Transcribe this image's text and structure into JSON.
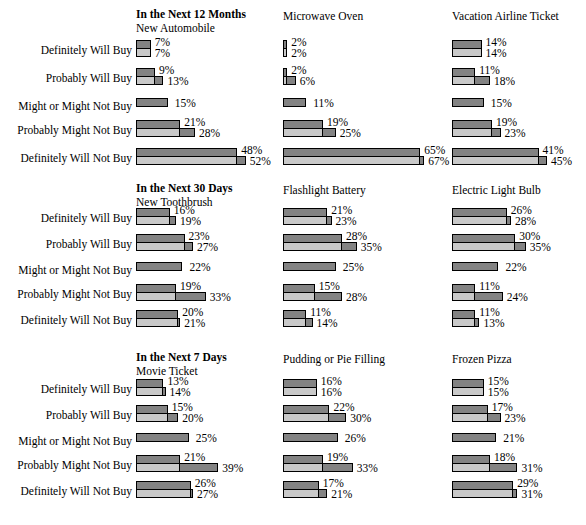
{
  "figure": {
    "row_labels": [
      "Definitely Will Buy",
      "Probably Will Buy",
      "Might or Might Not Buy",
      "Probably Might Not Buy",
      "Definitely Will Not Buy"
    ]
  },
  "chart_data": {
    "type": "bar",
    "xlabel": "",
    "ylabel": "",
    "xlim": [
      0,
      70
    ],
    "grid": false,
    "legend_position": "none",
    "orientation": "horizontal",
    "categories": [
      "Definitely Will Buy",
      "Probably Will Buy",
      "Might or Might Not Buy",
      "Probably Might Not Buy",
      "Definitely Will Not Buy"
    ],
    "series_names": [
      "top-dark",
      "bottom-light"
    ],
    "sections": [
      {
        "heading": "In the Next 12 Months",
        "columns": [
          {
            "product": "New Automobile",
            "rows": [
              {
                "label": "Definitely Will Buy",
                "top": 7,
                "bottom": 7
              },
              {
                "label": "Probably Will Buy",
                "top": 9,
                "bottom": 13
              },
              {
                "label": "Might or Might Not Buy",
                "top": 15,
                "bottom": null
              },
              {
                "label": "Probably Might Not Buy",
                "top": 21,
                "bottom": 28
              },
              {
                "label": "Definitely Will Not Buy",
                "top": 48,
                "bottom": 52
              }
            ]
          },
          {
            "product": "Microwave Oven",
            "rows": [
              {
                "label": "Definitely Will Buy",
                "top": 2,
                "bottom": 2
              },
              {
                "label": "Probably Will Buy",
                "top": 2,
                "bottom": 6
              },
              {
                "label": "Might or Might Not Buy",
                "top": 11,
                "bottom": null
              },
              {
                "label": "Probably Might Not Buy",
                "top": 19,
                "bottom": 25
              },
              {
                "label": "Definitely Will Not Buy",
                "top": 65,
                "bottom": 67
              }
            ]
          },
          {
            "product": "Vacation Airline Ticket",
            "rows": [
              {
                "label": "Definitely Will Buy",
                "top": 14,
                "bottom": 14
              },
              {
                "label": "Probably Will Buy",
                "top": 11,
                "bottom": 18
              },
              {
                "label": "Might or Might Not Buy",
                "top": 15,
                "bottom": null
              },
              {
                "label": "Probably Might Not Buy",
                "top": 19,
                "bottom": 23
              },
              {
                "label": "Definitely Will Not Buy",
                "top": 41,
                "bottom": 45
              }
            ]
          }
        ]
      },
      {
        "heading": "In the Next 30 Days",
        "columns": [
          {
            "product": "New Toothbrush",
            "rows": [
              {
                "label": "Definitely Will Buy",
                "top": 16,
                "bottom": 19
              },
              {
                "label": "Probably Will Buy",
                "top": 23,
                "bottom": 27
              },
              {
                "label": "Might or Might Not Buy",
                "top": 22,
                "bottom": null
              },
              {
                "label": "Probably Might Not Buy",
                "top": 19,
                "bottom": 33
              },
              {
                "label": "Definitely Will Not Buy",
                "top": 20,
                "bottom": 21
              }
            ]
          },
          {
            "product": "Flashlight Battery",
            "rows": [
              {
                "label": "Definitely Will Buy",
                "top": 21,
                "bottom": 23
              },
              {
                "label": "Probably Will Buy",
                "top": 28,
                "bottom": 35
              },
              {
                "label": "Might or Might Not Buy",
                "top": 25,
                "bottom": null
              },
              {
                "label": "Probably Might Not Buy",
                "top": 15,
                "bottom": 28
              },
              {
                "label": "Definitely Will Not Buy",
                "top": 11,
                "bottom": 14
              }
            ]
          },
          {
            "product": "Electric Light Bulb",
            "rows": [
              {
                "label": "Definitely Will Buy",
                "top": 26,
                "bottom": 28
              },
              {
                "label": "Probably Will Buy",
                "top": 30,
                "bottom": 35
              },
              {
                "label": "Might or Might Not Buy",
                "top": 22,
                "bottom": null
              },
              {
                "label": "Probably Might Not Buy",
                "top": 11,
                "bottom": 24
              },
              {
                "label": "Definitely Will Not Buy",
                "top": 11,
                "bottom": 13
              }
            ]
          }
        ]
      },
      {
        "heading": "In the Next 7 Days",
        "columns": [
          {
            "product": "Movie Ticket",
            "rows": [
              {
                "label": "Definitely Will Buy",
                "top": 13,
                "bottom": 14
              },
              {
                "label": "Probably Will Buy",
                "top": 15,
                "bottom": 20
              },
              {
                "label": "Might or Might Not Buy",
                "top": 25,
                "bottom": null
              },
              {
                "label": "Probably Might Not Buy",
                "top": 21,
                "bottom": 39
              },
              {
                "label": "Definitely Will Not Buy",
                "top": 26,
                "bottom": 27
              }
            ]
          },
          {
            "product": "Pudding or Pie Filling",
            "rows": [
              {
                "label": "Definitely Will Buy",
                "top": 16,
                "bottom": 16
              },
              {
                "label": "Probably Will Buy",
                "top": 22,
                "bottom": 30
              },
              {
                "label": "Might or Might Not Buy",
                "top": 26,
                "bottom": null
              },
              {
                "label": "Probably Might Not Buy",
                "top": 19,
                "bottom": 33
              },
              {
                "label": "Definitely Will Not Buy",
                "top": 17,
                "bottom": 21
              }
            ]
          },
          {
            "product": "Frozen Pizza",
            "rows": [
              {
                "label": "Definitely Will Buy",
                "top": 15,
                "bottom": 15
              },
              {
                "label": "Probably Will Buy",
                "top": 17,
                "bottom": 23
              },
              {
                "label": "Might or Might Not Buy",
                "top": 21,
                "bottom": null
              },
              {
                "label": "Probably Might Not Buy",
                "top": 18,
                "bottom": 31
              },
              {
                "label": "Definitely Will Not Buy",
                "top": 29,
                "bottom": 31
              }
            ]
          }
        ]
      }
    ],
    "colors": {
      "top_bar": "#838383",
      "bottom_bar": "#c9c9c9",
      "outline": "#000000",
      "background": "#ffffff"
    },
    "value_suffix": "%"
  },
  "layout": {
    "section_tops": [
      8,
      182,
      351
    ],
    "row_offsets": [
      36,
      64,
      92,
      116,
      144
    ],
    "row_offsets_b": [
      30,
      56,
      82,
      106,
      132
    ],
    "row_offsets_c": [
      32,
      58,
      84,
      108,
      134
    ],
    "col_lefts": [
      136,
      283,
      452
    ],
    "px_per_pct": 2.11,
    "label_right": 134
  }
}
